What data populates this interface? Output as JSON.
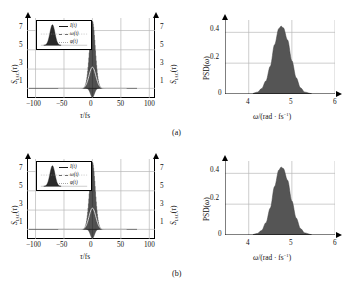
{
  "figure": {
    "panels": [
      {
        "tag": "(a)",
        "left_plot": {
          "ylabel_left": "S_IAC(τ)",
          "ylabel_right": "S_IAC(τ)",
          "xlabel": "τ/fs",
          "yticks": [
            "1",
            "3",
            "5",
            "7"
          ],
          "xticks": [
            "−100",
            "−50",
            "0",
            "50",
            "100"
          ],
          "legend": [
            {
              "label": "I(t)",
              "color": "#1a1a1a"
            },
            {
              "label": "ω(t)",
              "color": "#707070"
            },
            {
              "label": "φ(t)",
              "color": "#a8a8a8"
            }
          ]
        },
        "right_plot": {
          "ylabel": "PSD(ω)",
          "xlabel": "ω/(rad · fs⁻¹)",
          "yticks": [
            "0",
            "0.2",
            "0.4"
          ],
          "xticks": [
            "4",
            "5",
            "6"
          ]
        }
      },
      {
        "tag": "(b)",
        "left_plot": {
          "ylabel_left": "S_IAC(τ)",
          "ylabel_right": "S_IAC(τ)",
          "xlabel": "τ/fs",
          "yticks": [
            "1",
            "3",
            "5",
            "7"
          ],
          "xticks": [
            "−100",
            "−50",
            "0",
            "50",
            "100"
          ],
          "legend": [
            {
              "label": "I(t)",
              "color": "#1a1a1a"
            },
            {
              "label": "ω(t)",
              "color": "#707070"
            },
            {
              "label": "φ(t)",
              "color": "#a8a8a8"
            }
          ]
        },
        "right_plot": {
          "ylabel": "PSD(ω)",
          "xlabel": "ω/(rad · fs⁻¹)",
          "yticks": [
            "0",
            "0.2",
            "0.4"
          ],
          "xticks": [
            "4",
            "5",
            "6"
          ]
        }
      }
    ]
  },
  "colors": {
    "trace": "#111111",
    "envelope": "#d8d8d8",
    "psd_fill": "#555555",
    "grid": "#b9b9b9",
    "axis": "#000000"
  },
  "chart_data": [
    {
      "type": "line",
      "id": "iac-a",
      "title": "",
      "xlabel": "τ/fs",
      "ylabel": "S_IAC(τ)",
      "xlim": [
        -115,
        110
      ],
      "ylim": [
        0,
        8.3
      ],
      "xticks": [
        -100,
        -50,
        0,
        50,
        100
      ],
      "yticks": [
        1,
        3,
        5,
        7
      ],
      "grid": true,
      "legend_position": "inset-top-left",
      "series": [
        {
          "name": "interferometric autocorrelation",
          "peak_value": 8,
          "background_value": 1,
          "fwhm_fs": 12,
          "fringe_period_fs": 1.32
        },
        {
          "name": "intensity envelope",
          "peak_value": 3.2,
          "background_value": 1,
          "fwhm_fs": 14
        }
      ],
      "legend": [
        "I(t)",
        "ω(t)",
        "φ(t)"
      ]
    },
    {
      "type": "area",
      "id": "psd-a",
      "title": "",
      "xlabel": "ω/(rad · fs⁻¹)",
      "ylabel": "PSD(ω)",
      "xlim": [
        3.45,
        6.0
      ],
      "ylim": [
        0,
        0.48
      ],
      "xticks": [
        4,
        5,
        6
      ],
      "yticks": [
        0,
        0.2,
        0.4
      ],
      "grid": true,
      "x": [
        4.1,
        4.2,
        4.3,
        4.4,
        4.5,
        4.6,
        4.7,
        4.75,
        4.8,
        4.9,
        5.0,
        5.1,
        5.2,
        5.3,
        5.45
      ],
      "values": [
        0.005,
        0.012,
        0.035,
        0.085,
        0.18,
        0.32,
        0.425,
        0.44,
        0.43,
        0.35,
        0.215,
        0.105,
        0.04,
        0.012,
        0.003
      ],
      "peak": {
        "omega": 4.75,
        "psd": 0.44
      }
    },
    {
      "type": "line",
      "id": "iac-b",
      "title": "",
      "xlabel": "τ/fs",
      "ylabel": "S_IAC(τ)",
      "xlim": [
        -115,
        110
      ],
      "ylim": [
        0,
        8.3
      ],
      "xticks": [
        -100,
        -50,
        0,
        50,
        100
      ],
      "yticks": [
        1,
        3,
        5,
        7
      ],
      "grid": true,
      "legend_position": "inset-top-left",
      "series": [
        {
          "name": "interferometric autocorrelation",
          "peak_value": 8,
          "background_value": 1,
          "fwhm_fs": 12,
          "fringe_period_fs": 1.32
        },
        {
          "name": "intensity envelope",
          "peak_value": 3.2,
          "background_value": 1,
          "fwhm_fs": 14
        }
      ],
      "legend": [
        "I(t)",
        "ω(t)",
        "φ(t)"
      ]
    },
    {
      "type": "area",
      "id": "psd-b",
      "title": "",
      "xlabel": "ω/(rad · fs⁻¹)",
      "ylabel": "PSD(ω)",
      "xlim": [
        3.45,
        6.0
      ],
      "ylim": [
        0,
        0.48
      ],
      "xticks": [
        4,
        5,
        6
      ],
      "yticks": [
        0,
        0.2,
        0.4
      ],
      "grid": true,
      "x": [
        4.1,
        4.2,
        4.3,
        4.4,
        4.5,
        4.6,
        4.7,
        4.75,
        4.8,
        4.9,
        5.0,
        5.1,
        5.2,
        5.3,
        5.45
      ],
      "values": [
        0.004,
        0.01,
        0.03,
        0.08,
        0.175,
        0.315,
        0.422,
        0.44,
        0.432,
        0.355,
        0.22,
        0.11,
        0.042,
        0.013,
        0.003
      ],
      "peak": {
        "omega": 4.72,
        "psd": 0.44
      }
    }
  ]
}
